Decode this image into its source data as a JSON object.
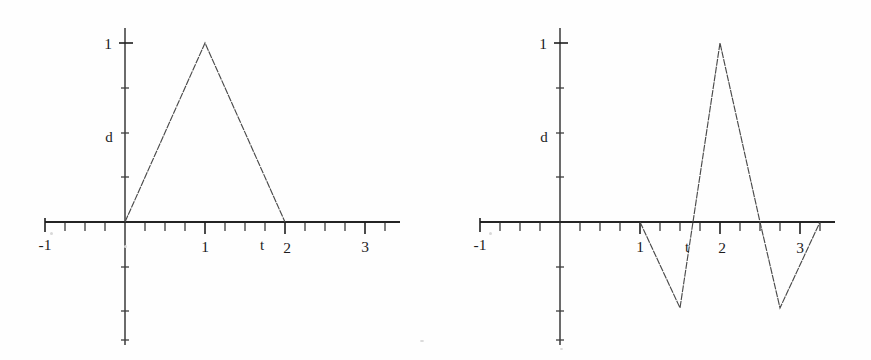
{
  "figure": {
    "background_color": "#fefefe",
    "ink_color": "#242424",
    "curve_color": "#4a4a4a",
    "panel_count": 2
  },
  "chart_data": [
    {
      "id": "left-panel",
      "type": "line",
      "title": "",
      "subtitle": "",
      "xlabel": "t",
      "ylabel": "d",
      "xlim": [
        -1.45,
        3.6
      ],
      "ylim": [
        -0.78,
        1.18
      ],
      "grid": false,
      "legend": null,
      "x_ticklabels": [
        "-1",
        "1",
        "2",
        "3"
      ],
      "x_ticklabel_values": [
        -1,
        1,
        2,
        3
      ],
      "x_minor_tick_step": 0.25,
      "y_ticklabels": [
        "1"
      ],
      "y_ticklabel_values": [
        1
      ],
      "y_minor_tick_step": 0.25,
      "series": [
        {
          "name": "triangular pulse",
          "x": [
            0,
            1,
            2
          ],
          "y": [
            0,
            1,
            0
          ]
        }
      ],
      "annotations": []
    },
    {
      "id": "right-panel",
      "type": "line",
      "title": "",
      "subtitle": "",
      "xlabel": "t",
      "ylabel": "d",
      "xlim": [
        -1.45,
        3.6
      ],
      "ylim": [
        -0.78,
        1.18
      ],
      "grid": false,
      "legend": null,
      "x_ticklabels": [
        "-1",
        "1",
        "2",
        "3"
      ],
      "x_ticklabel_values": [
        -1,
        1,
        2,
        3
      ],
      "x_minor_tick_step": 0.25,
      "y_ticklabels": [
        "1"
      ],
      "y_ticklabel_values": [
        1
      ],
      "y_minor_tick_step": 0.25,
      "series": [
        {
          "name": "bipolar triangular wavelet",
          "x": [
            1,
            1.5,
            2,
            2.5,
            2.75,
            3.25
          ],
          "y": [
            0,
            -0.48,
            1,
            0,
            -0.48,
            0
          ]
        }
      ],
      "annotations": []
    }
  ],
  "left": {
    "ylabel": "d",
    "xlabel": "t",
    "ytick_1": "1",
    "xtick_minus1": "-1",
    "xtick_1": "1",
    "xtick_2": "2",
    "xtick_3": "3"
  },
  "right": {
    "ylabel": "d",
    "xlabel": "t",
    "ytick_1": "1",
    "xtick_minus1": "-1",
    "xtick_1": "1",
    "xtick_2": "2",
    "xtick_3": "3"
  }
}
